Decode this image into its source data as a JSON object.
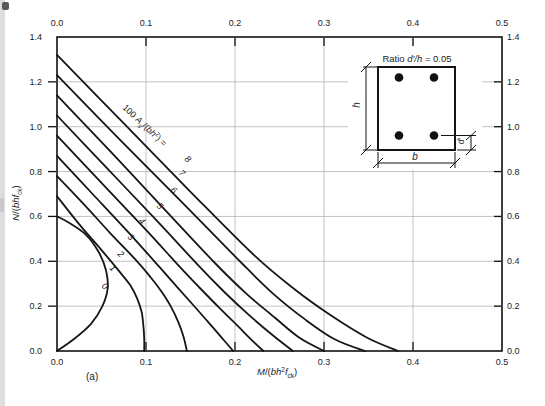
{
  "figure": {
    "panel_label": "(a)"
  },
  "axes_labels": {
    "x_parts": [
      {
        "t": "M",
        "s": "i"
      },
      {
        "t": "/("
      },
      {
        "t": "bh",
        "s": "i"
      },
      {
        "t": "2",
        "s": "sup"
      },
      {
        "t": "f",
        "s": "i"
      },
      {
        "t": "ck",
        "s": "sub"
      },
      {
        "t": ")"
      }
    ],
    "y_parts": [
      {
        "t": "N",
        "s": "i"
      },
      {
        "t": "/("
      },
      {
        "t": "bhf",
        "s": "i"
      },
      {
        "t": "ck",
        "s": "sub"
      },
      {
        "t": ")"
      }
    ]
  },
  "family_label_parts": [
    {
      "t": "100 "
    },
    {
      "t": "A",
      "s": "i"
    },
    {
      "t": "s",
      "s": "subi"
    },
    {
      "t": "/("
    },
    {
      "t": "bh",
      "s": "i"
    },
    {
      "t": "2",
      "s": "sup"
    },
    {
      "t": ") = "
    }
  ],
  "inset": {
    "title_parts": [
      {
        "t": "Ratio "
      },
      {
        "t": "d′/h",
        "s": "i"
      },
      {
        "t": " = 0.05"
      }
    ],
    "h_label": "h",
    "b_label": "b",
    "d_label": "d′"
  },
  "chart_data": {
    "type": "line",
    "xlabel": "M/(bh^2 fck)",
    "ylabel": "N/(bh fck)",
    "xlim": [
      0,
      0.5
    ],
    "ylim": [
      0,
      1.4
    ],
    "grid": {
      "x": [
        0.1,
        0.2,
        0.3,
        0.4
      ],
      "y": [
        0.2,
        0.4,
        0.6,
        0.8,
        1.0,
        1.2
      ]
    },
    "x_ticks": {
      "values": [
        0,
        0.1,
        0.2,
        0.3,
        0.4,
        0.5
      ],
      "labels": [
        "0.0",
        "0.1",
        "0.2",
        "0.3",
        "0.4",
        "0.5"
      ]
    },
    "y_ticks": {
      "values": [
        0,
        0.2,
        0.4,
        0.6,
        0.8,
        1.0,
        1.2,
        1.4
      ],
      "labels": [
        "0.0",
        "0.2",
        "0.4",
        "0.6",
        "0.8",
        "1.0",
        "1.2",
        "1.4"
      ]
    },
    "legend": "none",
    "family_parameter": "100As/(bh2)",
    "series": [
      {
        "name": "0",
        "label_pos": [
          0.054,
          0.29
        ],
        "points": [
          [
            0,
            0.6
          ],
          [
            0.012,
            0.575
          ],
          [
            0.032,
            0.52
          ],
          [
            0.047,
            0.44
          ],
          [
            0.055,
            0.36
          ],
          [
            0.057,
            0.28
          ],
          [
            0.051,
            0.2
          ],
          [
            0.038,
            0.12
          ],
          [
            0.018,
            0.05
          ],
          [
            0,
            0
          ]
        ]
      },
      {
        "name": "1",
        "label_pos": [
          0.063,
          0.371
        ],
        "points": [
          [
            0,
            0.69
          ],
          [
            0.025,
            0.565
          ],
          [
            0.05,
            0.45
          ],
          [
            0.07,
            0.355
          ],
          [
            0.082,
            0.295
          ],
          [
            0.09,
            0.235
          ],
          [
            0.095,
            0.175
          ],
          [
            0.097,
            0.115
          ],
          [
            0.098,
            0.055
          ],
          [
            0.098,
            0
          ]
        ]
      },
      {
        "name": "2",
        "label_pos": [
          0.072,
          0.433
        ],
        "points": [
          [
            0,
            0.78
          ],
          [
            0.03,
            0.655
          ],
          [
            0.06,
            0.525
          ],
          [
            0.09,
            0.4
          ],
          [
            0.105,
            0.33
          ],
          [
            0.118,
            0.262
          ],
          [
            0.128,
            0.198
          ],
          [
            0.136,
            0.132
          ],
          [
            0.142,
            0.066
          ],
          [
            0.146,
            0
          ]
        ]
      },
      {
        "name": "3",
        "label_pos": [
          0.083,
          0.509
        ],
        "points": [
          [
            0,
            0.87
          ],
          [
            0.04,
            0.7
          ],
          [
            0.08,
            0.53
          ],
          [
            0.115,
            0.375
          ],
          [
            0.135,
            0.285
          ],
          [
            0.153,
            0.205
          ],
          [
            0.169,
            0.133
          ],
          [
            0.184,
            0.064
          ],
          [
            0.198,
            0
          ]
        ]
      },
      {
        "name": "4",
        "label_pos": [
          0.0955,
          0.58
        ],
        "points": [
          [
            0,
            0.96
          ],
          [
            0.05,
            0.75
          ],
          [
            0.1,
            0.54
          ],
          [
            0.138,
            0.375
          ],
          [
            0.16,
            0.283
          ],
          [
            0.183,
            0.19
          ],
          [
            0.203,
            0.112
          ],
          [
            0.218,
            0.052
          ],
          [
            0.232,
            0
          ]
        ]
      },
      {
        "name": "5",
        "label_pos": [
          0.116,
          0.647
        ],
        "points": [
          [
            0,
            1.05
          ],
          [
            0.055,
            0.82
          ],
          [
            0.11,
            0.59
          ],
          [
            0.158,
            0.385
          ],
          [
            0.188,
            0.263
          ],
          [
            0.215,
            0.163
          ],
          [
            0.24,
            0.078
          ],
          [
            0.265,
            0
          ]
        ]
      },
      {
        "name": "6",
        "label_pos": [
          0.131,
          0.72
        ],
        "points": [
          [
            0,
            1.14
          ],
          [
            0.06,
            0.89
          ],
          [
            0.12,
            0.635
          ],
          [
            0.178,
            0.39
          ],
          [
            0.213,
            0.255
          ],
          [
            0.245,
            0.148
          ],
          [
            0.272,
            0.06
          ],
          [
            0.3,
            0
          ]
        ]
      },
      {
        "name": "7",
        "label_pos": [
          0.141,
          0.795
        ],
        "points": [
          [
            0,
            1.23
          ],
          [
            0.07,
            0.945
          ],
          [
            0.14,
            0.665
          ],
          [
            0.208,
            0.39
          ],
          [
            0.243,
            0.255
          ],
          [
            0.278,
            0.143
          ],
          [
            0.312,
            0.052
          ],
          [
            0.346,
            0
          ]
        ]
      },
      {
        "name": "8",
        "label_pos": [
          0.147,
          0.858
        ],
        "points": [
          [
            0,
            1.32
          ],
          [
            0.075,
            1.015
          ],
          [
            0.15,
            0.71
          ],
          [
            0.222,
            0.425
          ],
          [
            0.268,
            0.272
          ],
          [
            0.308,
            0.158
          ],
          [
            0.348,
            0.06
          ],
          [
            0.383,
            0
          ]
        ]
      }
    ]
  }
}
